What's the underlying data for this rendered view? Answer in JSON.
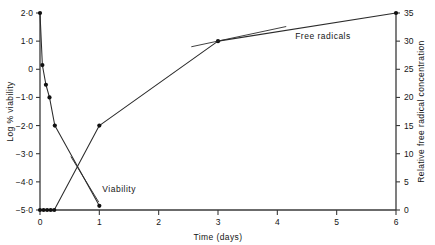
{
  "chart_data": {
    "type": "line",
    "title": "",
    "xlabel": "Time (days)",
    "ylabel": "Log % viability",
    "y2label": "Relative free radical concentration",
    "xlim": [
      0,
      6
    ],
    "ylim": [
      -5.0,
      2.0
    ],
    "y2lim": [
      0,
      35
    ],
    "grid": false,
    "legend_position": "inline-annotations",
    "xticks": [
      0,
      1,
      2,
      3,
      4,
      5,
      6
    ],
    "xticklabels": [
      "0",
      "1",
      "2",
      "3",
      "4",
      "5",
      "6"
    ],
    "yticks": [
      2.0,
      1.0,
      0,
      -1.0,
      -2.0,
      -3.0,
      -4.0,
      -5.0
    ],
    "yticklabels": [
      "2·0",
      "1·0",
      "0",
      "−1·0",
      "−2·0",
      "−3·0",
      "−4·0",
      "−5·0"
    ],
    "y2ticks": [
      0,
      5,
      10,
      15,
      20,
      25,
      30,
      35
    ],
    "y2ticklabels": [
      "0",
      "5",
      "10",
      "15",
      "20",
      "25",
      "30",
      "35"
    ],
    "series": [
      {
        "name": "Viability",
        "axis": "left",
        "annotation": "Viability",
        "x": [
          0.0,
          0.04,
          0.1,
          0.16,
          0.25,
          1.0
        ],
        "y": [
          2.0,
          0.15,
          -0.55,
          -1.0,
          -2.0,
          -4.85
        ]
      },
      {
        "name": "Free radicals",
        "axis": "right",
        "annotation": "Free radicals",
        "x": [
          0.0,
          0.06,
          0.12,
          0.18,
          0.24,
          1.0,
          3.0,
          6.0
        ],
        "y": [
          0.0,
          0.0,
          0.0,
          0.0,
          0.0,
          15.0,
          30.0,
          35.0
        ]
      }
    ],
    "annotations": [
      {
        "text": "Viability",
        "x": 1.0,
        "y": -4.85
      },
      {
        "text": "Free radicals",
        "x": 4.25,
        "y": 31.5
      }
    ]
  }
}
